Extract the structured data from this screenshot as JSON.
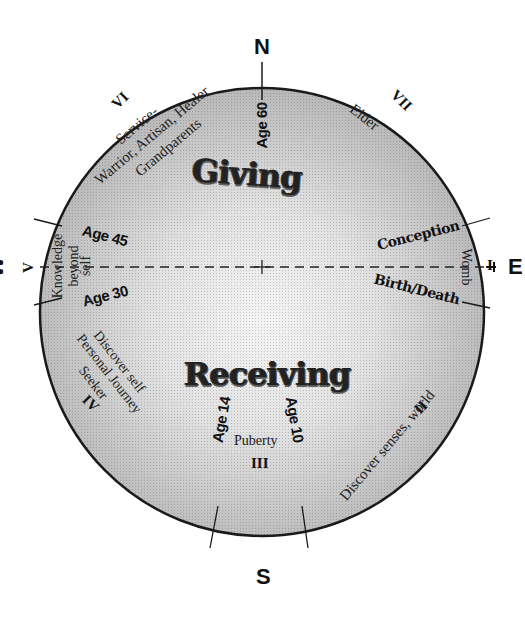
{
  "diagram": {
    "compass": {
      "north": "N",
      "south": "S",
      "east": "E",
      "west": "W"
    },
    "center_axis": "dashed east-west line with center cross",
    "quadrants": {
      "giving": "Giving",
      "receiving": "Receiving"
    },
    "stages": [
      {
        "numeral": "I",
        "label": "Womb",
        "position": "east"
      },
      {
        "numeral": "II",
        "label": "Discover senses, world",
        "position": "south-east"
      },
      {
        "numeral": "III",
        "label": "Puberty",
        "position": "south"
      },
      {
        "numeral": "IV",
        "label_lines": [
          "Discover self",
          "Personal Journey",
          "Seeker"
        ],
        "position": "south-west"
      },
      {
        "numeral": "V",
        "label_lines": [
          "Knowledge",
          "beyond",
          "self"
        ],
        "position": "west"
      },
      {
        "numeral": "VI",
        "label_lines": [
          "Service-",
          "Warrior, Artisan, Healer",
          "Grandparents"
        ],
        "position": "north-west"
      },
      {
        "numeral": "VII",
        "label": "Elder",
        "position": "north-east"
      }
    ],
    "ages": {
      "age60": "Age 60",
      "age45": "Age 45",
      "age30": "Age 30",
      "age14": "Age 14",
      "age10": "Age 10"
    },
    "events": {
      "conception": "Conception",
      "birth_death": "Birth/Death"
    },
    "colors": {
      "rim": "#1a1a1a",
      "fill_outer": "#b9b9b9",
      "fill_inner": "#f2f2f2",
      "background": "#ffffff"
    }
  }
}
